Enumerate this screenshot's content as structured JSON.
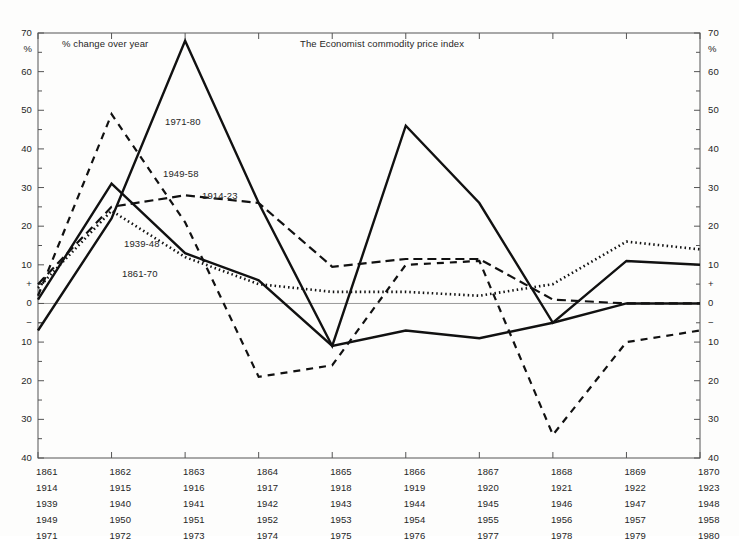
{
  "chart_data": {
    "type": "line",
    "title": "The Economist commodity price index",
    "subtitle": "% change over year",
    "ylabel": "%",
    "xlabel": "",
    "ylim": [
      -40,
      70
    ],
    "grid": false,
    "zero_line": true,
    "legend": "inline-labels",
    "y_ticks": [
      70,
      60,
      50,
      40,
      30,
      20,
      10,
      0,
      -10,
      -20,
      -30,
      -40
    ],
    "y_tick_labels": [
      "70",
      "60",
      "50",
      "40",
      "30",
      "20",
      "10",
      "0",
      "10",
      "20",
      "30",
      "40"
    ],
    "y_minor_ticks": [
      65,
      55,
      45,
      35,
      25,
      15,
      5,
      -5,
      -15,
      -25,
      -35
    ],
    "y_sign_plus_at": 5,
    "y_sign_minus_at": -5,
    "x_positions": [
      1,
      2,
      3,
      4,
      5,
      6,
      7,
      8,
      9,
      10
    ],
    "x_tick_rows": [
      [
        "1861",
        "1862",
        "1863",
        "1864",
        "1865",
        "1866",
        "1867",
        "1868",
        "1869",
        "1870"
      ],
      [
        "1914",
        "1915",
        "1916",
        "1917",
        "1918",
        "1919",
        "1920",
        "1921",
        "1922",
        "1923"
      ],
      [
        "1939",
        "1940",
        "1941",
        "1942",
        "1943",
        "1944",
        "1945",
        "1946",
        "1947",
        "1948"
      ],
      [
        "1949",
        "1950",
        "1951",
        "1952",
        "1953",
        "1954",
        "1955",
        "1956",
        "1957",
        "1958"
      ],
      [
        "1971",
        "1972",
        "1973",
        "1974",
        "1975",
        "1976",
        "1977",
        "1978",
        "1979",
        "1980"
      ]
    ],
    "series": [
      {
        "name": "1861-70",
        "style": "solid",
        "width": 2.4,
        "color": "#111111",
        "values": [
          1,
          31,
          13,
          6,
          -11,
          -7,
          -9,
          -5,
          0,
          0
        ]
      },
      {
        "name": "1914-23",
        "style": "dashed",
        "width": 2.2,
        "color": "#111111",
        "dash": "9,5",
        "values": [
          5,
          25,
          28,
          26,
          9.5,
          11.5,
          11.5,
          1,
          0,
          0
        ]
      },
      {
        "name": "1939-48",
        "style": "dotted",
        "width": 2.6,
        "color": "#111111",
        "dash": "1.5,3",
        "values": [
          4,
          24,
          12,
          5,
          3,
          3,
          2,
          5,
          16,
          14
        ]
      },
      {
        "name": "1949-58",
        "style": "dashed",
        "width": 2.2,
        "color": "#111111",
        "dash": "7,6",
        "values": [
          2,
          49,
          21,
          -19,
          -16,
          10,
          11,
          -34,
          -10,
          -7
        ]
      },
      {
        "name": "1971-80",
        "style": "solid",
        "width": 2.4,
        "color": "#111111",
        "values": [
          -7,
          22,
          68,
          26,
          -11,
          46,
          26,
          -5,
          11,
          10
        ]
      }
    ],
    "series_annotations": [
      {
        "label": "1971-80",
        "x_px": 165,
        "y_px": 116
      },
      {
        "label": "1949-58",
        "x_px": 163,
        "y_px": 168
      },
      {
        "label": "1914-23",
        "x_px": 202,
        "y_px": 190
      },
      {
        "label": "1939-48",
        "x_px": 124,
        "y_px": 238
      },
      {
        "label": "1861-70",
        "x_px": 122,
        "y_px": 268
      }
    ]
  },
  "axes": {
    "left_labels": [
      "70",
      "%",
      "60",
      "50",
      "40",
      "30",
      "20",
      "10",
      "+",
      "0",
      "−",
      "10",
      "20",
      "30",
      "40"
    ],
    "right_labels": [
      "70",
      "%",
      "60",
      "50",
      "40",
      "30",
      "20",
      "10",
      "+",
      "0",
      "−",
      "10",
      "20",
      "30",
      "40"
    ]
  },
  "header": {
    "left_caption": "% change over year",
    "center_caption": "The Economist commodity price index"
  },
  "colors": {
    "ink": "#111111",
    "axis": "#555555",
    "zero_line": "#999999",
    "background": "#fdfdfc"
  }
}
